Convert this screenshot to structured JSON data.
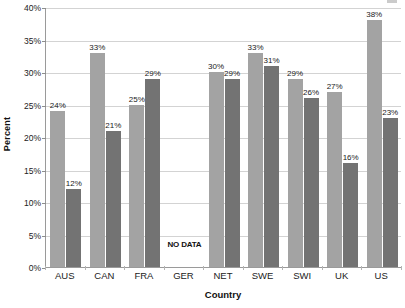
{
  "chart_data": {
    "type": "bar",
    "title": "",
    "subtitle": "",
    "xlabel": "Country",
    "ylabel": "Percent",
    "categories": [
      "AUS",
      "CAN",
      "FRA",
      "GER",
      "NET",
      "SWE",
      "SWI",
      "UK",
      "US"
    ],
    "series": [
      {
        "name": "Series 1",
        "color": "#a3a3a3",
        "values": [
          24,
          33,
          25,
          null,
          30,
          33,
          29,
          27,
          38
        ],
        "labels": [
          "24%",
          "33%",
          "25%",
          null,
          "30%",
          "33%",
          "29%",
          "27%",
          "38%"
        ]
      },
      {
        "name": "Series 2",
        "color": "#737373",
        "values": [
          12,
          21,
          29,
          null,
          29,
          31,
          26,
          16,
          23
        ],
        "labels": [
          "12%",
          "21%",
          "29%",
          null,
          "29%",
          "31%",
          "26%",
          "16%",
          "23%"
        ]
      }
    ],
    "ylim": [
      0,
      40
    ],
    "ytick_values": [
      0,
      5,
      10,
      15,
      20,
      25,
      30,
      35,
      40
    ],
    "ytick_labels": [
      "0%",
      "5%",
      "10%",
      "15%",
      "20%",
      "25%",
      "30%",
      "35%",
      "40%"
    ],
    "grid": true,
    "legend": "none",
    "annotations": [
      {
        "category": "GER",
        "text": "NO DATA",
        "note": "bold text drawn near baseline in place of missing bars"
      }
    ]
  }
}
